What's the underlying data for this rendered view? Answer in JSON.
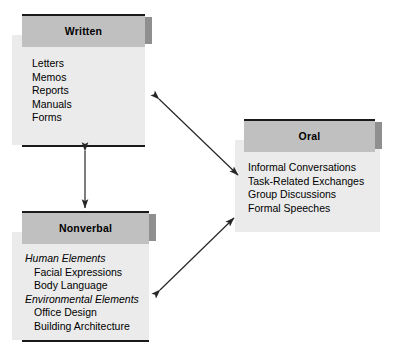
{
  "diagram": {
    "type": "communication-channels",
    "nodes": [
      {
        "id": "written",
        "title": "Written",
        "items": [
          {
            "text": "Letters",
            "style": "plain"
          },
          {
            "text": "Memos",
            "style": "plain"
          },
          {
            "text": "Reports",
            "style": "plain"
          },
          {
            "text": "Manuals",
            "style": "plain"
          },
          {
            "text": "Forms",
            "style": "plain"
          }
        ]
      },
      {
        "id": "oral",
        "title": "Oral",
        "items": [
          {
            "text": "Informal Conversations",
            "style": "plain"
          },
          {
            "text": "Task-Related Exchanges",
            "style": "plain"
          },
          {
            "text": "Group Discussions",
            "style": "plain"
          },
          {
            "text": "Formal Speeches",
            "style": "plain"
          }
        ]
      },
      {
        "id": "nonverbal",
        "title": "Nonverbal",
        "items": [
          {
            "text": "Human Elements",
            "style": "group"
          },
          {
            "text": "Facial Expressions",
            "style": "sub"
          },
          {
            "text": "Body Language",
            "style": "sub"
          },
          {
            "text": "Environmental Elements",
            "style": "group"
          },
          {
            "text": "Office Design",
            "style": "sub"
          },
          {
            "text": "Building Architecture",
            "style": "sub"
          }
        ]
      }
    ],
    "connectors": [
      {
        "id": "written-nonverbal",
        "from": "written",
        "to": "nonverbal",
        "arrows": "both"
      },
      {
        "id": "written-oral",
        "from": "written",
        "to": "oral",
        "arrows": "both"
      },
      {
        "id": "nonverbal-oral",
        "from": "nonverbal",
        "to": "oral",
        "arrows": "both"
      }
    ],
    "colors": {
      "header_fill": "#c0c0c0",
      "body_fill": "#ebebeb",
      "tab_fill": "#8f8f8f",
      "rule": "#1a1a1a",
      "connector": "#262626",
      "text": "#000000",
      "page_background": "#ffffff"
    }
  }
}
